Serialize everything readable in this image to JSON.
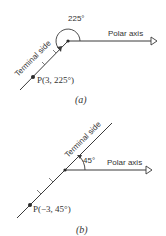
{
  "figure_a": {
    "caption": "(a)",
    "angle_label": "225°",
    "polar_axis_label": "Polar axis",
    "terminal_side_label": "Terminal side",
    "point_label": "P(3, 225°)",
    "point": {
      "r": 3,
      "theta_deg": 225
    }
  },
  "figure_b": {
    "caption": "(b)",
    "angle_label": "45°",
    "polar_axis_label": "Polar axis",
    "terminal_side_label": "Terminal side",
    "point_label": "P(−3, 45°)",
    "point": {
      "r": -3,
      "theta_deg": 45
    }
  },
  "colors": {
    "ink": "#3a3a3a",
    "background": "#ffffff"
  }
}
